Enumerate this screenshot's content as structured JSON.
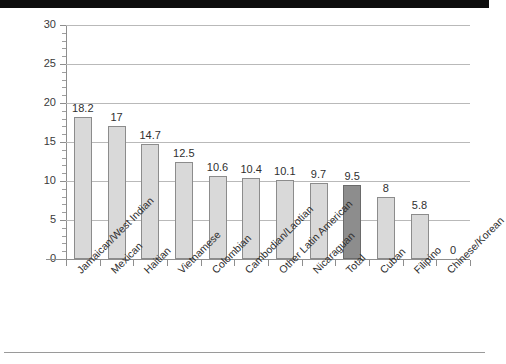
{
  "chart_data": {
    "type": "bar",
    "title": "",
    "subtitle": "",
    "xlabel": "",
    "ylabel": "",
    "ylim": [
      0,
      30
    ],
    "ytick_step": 5,
    "yticks": [
      "0",
      "5",
      "10",
      "15",
      "20",
      "25",
      "30"
    ],
    "grid": true,
    "legend": "none",
    "categories": [
      "Jamaican/West Indian",
      "Mexican",
      "Haitian",
      "Vietnamese",
      "Colombian",
      "Cambodian/Laotian",
      "Other Latin American",
      "Nicaraguan",
      "Total",
      "Cuban",
      "Filipino",
      "Chinese/Korean"
    ],
    "values": [
      18.2,
      17,
      14.7,
      12.5,
      10.6,
      10.4,
      10.1,
      9.7,
      9.5,
      8,
      5.8,
      0
    ],
    "value_labels": [
      "18.2",
      "17",
      "14.7",
      "12.5",
      "10.6",
      "10.4",
      "10.1",
      "9.7",
      "9.5",
      "8",
      "5.8",
      "0"
    ],
    "highlight_index": 8,
    "colors": {
      "bar": "#d9d9d9",
      "bar_border": "#8c8c8c",
      "bar_highlight": "#8d8d8d",
      "bar_highlight_border": "#6a6a6a",
      "gridline": "#b9b9b9",
      "axis": "#8e8e8e",
      "text": "#2f2f2f",
      "top_band": "#0d0d0d",
      "background": "#ffffff"
    }
  }
}
